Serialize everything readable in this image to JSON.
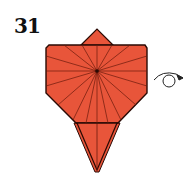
{
  "step": {
    "number": "31"
  },
  "colors": {
    "paper": "#e8553a",
    "crease": "#6a1a0c",
    "outline": "#2a0a04",
    "arrow": "#222222"
  },
  "diagram": {
    "center_point": [
      97,
      71
    ],
    "turn_over_symbol": "turn-over-arrow"
  }
}
